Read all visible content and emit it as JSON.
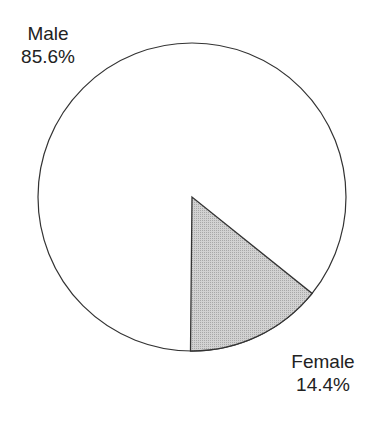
{
  "chart_data": {
    "type": "pie",
    "title": "",
    "slices": [
      {
        "label": "Male",
        "value": 85.6,
        "display": "85.6%",
        "color": "#ffffff"
      },
      {
        "label": "Female",
        "value": 14.4,
        "display": "14.4%",
        "color": "#c8c8c8"
      }
    ],
    "legend": "none",
    "labels_position": "outside"
  },
  "labels": {
    "male": {
      "name": "Male",
      "pct": "85.6%"
    },
    "female": {
      "name": "Female",
      "pct": "14.4%"
    }
  }
}
